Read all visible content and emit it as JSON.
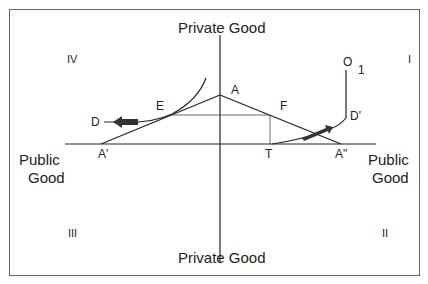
{
  "diagram": {
    "axes": {
      "top": "Private Good",
      "bottom": "Private Good",
      "left_line1": "Public",
      "left_line2": "Good",
      "right_line1": "Public",
      "right_line2": "Good"
    },
    "quadrants": {
      "I": "I",
      "II": "II",
      "III": "III",
      "IV": "IV"
    },
    "points": {
      "A": "A",
      "A_prime": "A'",
      "A_double_prime": "A\"",
      "D": "D",
      "D_prime": "D'",
      "E": "E",
      "F": "F",
      "T": "T",
      "O": "O",
      "O_sub": "1"
    },
    "colors": {
      "line": "#222222",
      "frame": "#555555",
      "arrow": "#333333"
    }
  }
}
